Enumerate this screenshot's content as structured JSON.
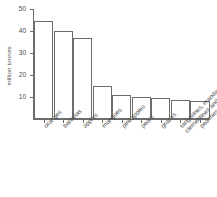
{
  "chart_data": {
    "type": "bar",
    "title": "",
    "xlabel": "",
    "ylabel": "million tonnes",
    "ylim": [
      0,
      50
    ],
    "yticks": [
      10,
      20,
      30,
      40,
      50
    ],
    "grid": false,
    "legend": null,
    "categories": [
      "oranges",
      "bananas",
      "apples",
      "mangoes",
      "pineapples",
      "pears",
      "grapes",
      "tangerines, mandarins, clementines and satsumas",
      "peaches and nectarines"
    ],
    "category_lines": [
      [
        "oranges"
      ],
      [
        "bananas"
      ],
      [
        "apples"
      ],
      [
        "mangoes"
      ],
      [
        "pineapples"
      ],
      [
        "pears"
      ],
      [
        "grapes"
      ],
      [
        "tangerines, mandarins,",
        "clementines and satsumas"
      ],
      [
        "peaches and nectarines"
      ]
    ],
    "values": [
      44.4,
      39.8,
      37.0,
      15.0,
      11.0,
      10.0,
      9.5,
      8.6,
      8.0
    ],
    "bar_color": "#ffffff",
    "bar_edge_color": "#6d6d6d",
    "axis_color": "#6d6d6d",
    "text_color": "#4a4a4a",
    "background_color": "#ffffff"
  }
}
